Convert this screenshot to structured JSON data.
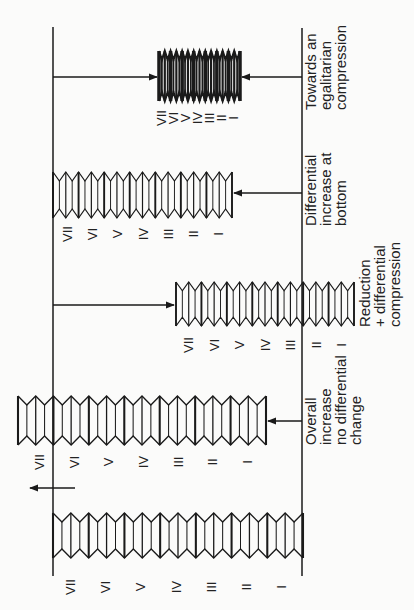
{
  "diagram": {
    "ranks": [
      "VII",
      "VI",
      "V",
      "IV",
      "III",
      "II",
      "I"
    ],
    "panels": [
      {
        "id": "baseline",
        "caption_lines": [],
        "labels": [
          "VII",
          "VI",
          "V",
          "IV",
          "III",
          "II",
          "I"
        ]
      },
      {
        "id": "overall-increase",
        "caption_lines": [
          "Overall",
          "increase",
          "no differential",
          "change"
        ],
        "labels": [
          "VII",
          "VI",
          "V",
          "IV",
          "III",
          "II",
          "I"
        ]
      },
      {
        "id": "reduction",
        "caption_lines": [
          "Reduction",
          "+ differential",
          "compression"
        ],
        "labels": [
          "VII",
          "VI",
          "V",
          "IV",
          "III",
          "II",
          "I"
        ]
      },
      {
        "id": "differential-increase",
        "caption_lines": [
          "Differential",
          "increase at",
          "bottom"
        ],
        "labels": [
          "VII",
          "VI",
          "V",
          "IV",
          "III",
          "II",
          "I"
        ]
      },
      {
        "id": "egalitarian",
        "caption_lines": [
          "Towards an",
          "egalitarian",
          "compression"
        ],
        "labels": [
          "VII",
          "VI",
          "V",
          "IV",
          "III",
          "II",
          "I"
        ]
      }
    ]
  },
  "colors": {
    "ink": "#1a1a1a",
    "background": "#fbfbfa"
  }
}
